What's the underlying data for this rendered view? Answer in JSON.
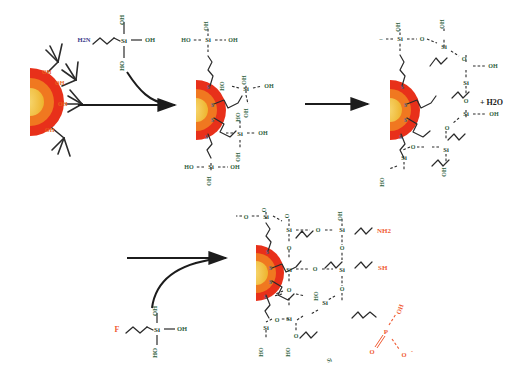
{
  "figure": {
    "type": "chemical-reaction-scheme",
    "background": "#ffffff"
  },
  "colors": {
    "bond": "#2b2b2b",
    "hetero_text": "#2e5e3e",
    "functional_red": "#f05a32",
    "particle_outer": "#e8301a",
    "particle_mid": "#f07820",
    "particle_core": "#f2c040",
    "oh_orange": "#e8631a"
  },
  "steps": {
    "step1": {
      "reagent_label": "3-aminopropylsilanetriol",
      "reagent_atoms": {
        "amine": "H2N",
        "center": "Si",
        "top": "OH",
        "right": "OH",
        "bottom": "HO"
      },
      "arrow": "reaction-arrow-1"
    },
    "step2": {
      "arrow": "reaction-arrow-2",
      "byproduct": "+ H2O"
    },
    "step3": {
      "reagent_label": "functional-propylsilanetriol",
      "reagent_atoms": {
        "functional": "F",
        "center": "Si",
        "top": "OH",
        "right": "OH",
        "bottom": "HO"
      },
      "arrow": "reaction-arrow-3"
    }
  },
  "structures": {
    "particle": {
      "surface_group": "OH",
      "linkage": "S"
    },
    "intermediate": {
      "silicon": "Si",
      "hydroxyl": "OH",
      "hydroxyl_rev": "HO",
      "linkage": "S"
    },
    "condensed": {
      "silicon": "Si",
      "oxygen_bridge": "O",
      "hydroxyl": "OH",
      "hydroxyl_rev": "HO",
      "linkage": "S"
    },
    "product": {
      "silicon": "Si",
      "oxygen_bridge": "O",
      "hydroxyl": "OH",
      "hydroxyl_rev": "HO",
      "linkage": "S",
      "functional_groups": [
        {
          "name": "amine",
          "label": "NH2"
        },
        {
          "name": "thiol",
          "label": "SH"
        },
        {
          "name": "phosphonate-p",
          "label": "P"
        },
        {
          "name": "phosphonate-oh",
          "label": "OH"
        },
        {
          "name": "phosphonate-o-minus",
          "label": "O"
        },
        {
          "name": "phosphonate-o-double",
          "label": "O"
        },
        {
          "name": "phosphonate-charge",
          "label": "-"
        }
      ],
      "extra_labels": [
        "Si"
      ]
    }
  }
}
